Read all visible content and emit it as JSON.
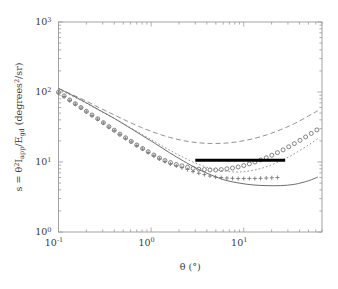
{
  "figure": {
    "background_color": "#ffffff",
    "frame_color": "#9a9a9a",
    "width": 338,
    "height": 289
  },
  "chart_data": {
    "type": "line",
    "title": "",
    "xlabel": "θ (°)",
    "ylabel": "s = θ²I_app/E_gd (degrees²/sr)",
    "xscale": "log",
    "yscale": "log",
    "xlim": [
      0.1,
      70.0
    ],
    "ylim": [
      1.0,
      1000.0
    ],
    "grid": false,
    "legend": "none",
    "x_tick_labels": [
      "10⁻¹",
      "10⁰",
      "10¹"
    ],
    "x_tick_values": [
      0.1,
      1.0,
      10.0
    ],
    "y_tick_labels": [
      "10⁰",
      "10¹",
      "10²",
      "10³"
    ],
    "y_tick_values": [
      1.0,
      10.0,
      100.0,
      1000.0
    ],
    "series": [
      {
        "name": "measured-circles",
        "style": "markers",
        "marker": "circle-open",
        "color": "#6e6e6e",
        "x": [
          0.1,
          0.115,
          0.132,
          0.152,
          0.175,
          0.2,
          0.23,
          0.265,
          0.305,
          0.35,
          0.4,
          0.46,
          0.53,
          0.61,
          0.7,
          0.81,
          0.93,
          1.07,
          1.23,
          1.41,
          1.62,
          1.87,
          2.15,
          2.47,
          2.84,
          3.27,
          3.76,
          4.32,
          4.97,
          5.72,
          6.58,
          7.56,
          8.7,
          10.0,
          11.5,
          13.2,
          15.2,
          17.5,
          20.1,
          23.1,
          26.6,
          30.6,
          35.2,
          40.5,
          46.6,
          53.6,
          61.6
        ],
        "y": [
          99.0,
          88.0,
          77.0,
          68.0,
          60.0,
          53.0,
          47.0,
          41.5,
          36.5,
          32.0,
          28.5,
          25.0,
          22.2,
          19.7,
          17.5,
          15.6,
          14.0,
          12.6,
          11.4,
          10.5,
          9.8,
          9.2,
          8.8,
          8.4,
          8.1,
          7.9,
          7.8,
          7.7,
          7.7,
          7.8,
          8.0,
          8.2,
          8.5,
          8.9,
          9.4,
          10.0,
          10.7,
          11.5,
          12.5,
          13.6,
          14.9,
          16.5,
          18.3,
          20.4,
          22.8,
          25.6,
          28.7
        ]
      },
      {
        "name": "measured-plus",
        "style": "markers",
        "marker": "plus",
        "color": "#7a7a7a",
        "x": [
          0.1,
          0.115,
          0.132,
          0.152,
          0.175,
          0.2,
          0.23,
          0.265,
          0.305,
          0.35,
          0.4,
          0.46,
          0.53,
          0.61,
          0.7,
          0.81,
          0.93,
          1.07,
          1.23,
          1.41,
          1.62,
          1.87,
          2.15,
          2.47,
          2.84,
          3.27,
          3.76,
          4.32,
          4.97,
          5.72,
          6.58,
          7.56,
          8.7,
          10.0,
          11.5,
          13.2,
          15.2,
          17.5,
          20.1,
          23.1
        ],
        "y": [
          97.0,
          86.0,
          76.0,
          67.0,
          59.0,
          52.0,
          46.0,
          41.0,
          36.0,
          31.5,
          28.0,
          24.6,
          21.8,
          19.3,
          17.2,
          15.3,
          13.7,
          12.3,
          11.1,
          10.2,
          9.4,
          8.8,
          8.3,
          7.8,
          7.3,
          6.9,
          6.6,
          6.3,
          6.1,
          6.0,
          5.9,
          5.85,
          5.8,
          5.8,
          5.8,
          5.8,
          5.85,
          5.9,
          5.95,
          6.0
        ]
      },
      {
        "name": "model-dashed-upper",
        "style": "dashed",
        "color": "#8c8c8c",
        "x": [
          0.1,
          0.14,
          0.2,
          0.28,
          0.4,
          0.56,
          0.79,
          1.12,
          1.58,
          2.24,
          3.16,
          4.47,
          6.31,
          8.91,
          12.6,
          17.8,
          25.1,
          35.5,
          50.1,
          63.0
        ],
        "y": [
          112.0,
          92.0,
          74.0,
          59.0,
          47.0,
          38.0,
          31.0,
          26.0,
          22.5,
          20.2,
          18.9,
          18.4,
          18.6,
          19.6,
          21.5,
          24.5,
          29.0,
          35.5,
          45.5,
          54.0
        ]
      },
      {
        "name": "model-dotted-middle",
        "style": "dotted",
        "color": "#8c8c8c",
        "x": [
          0.1,
          0.14,
          0.2,
          0.28,
          0.4,
          0.56,
          0.79,
          1.12,
          1.58,
          2.24,
          3.16,
          4.47,
          6.31,
          8.91,
          12.6,
          17.8,
          25.1,
          35.5,
          50.1,
          63.0
        ],
        "y": [
          110.0,
          88.0,
          69.0,
          54.0,
          42.0,
          32.5,
          25.0,
          19.2,
          14.8,
          11.6,
          9.4,
          8.1,
          7.4,
          7.2,
          7.6,
          8.6,
          10.4,
          13.2,
          17.5,
          21.5
        ]
      },
      {
        "name": "model-solid-lower",
        "style": "solid",
        "color": "#6e6e6e",
        "x": [
          0.1,
          0.14,
          0.2,
          0.28,
          0.4,
          0.56,
          0.79,
          1.12,
          1.58,
          2.24,
          3.16,
          4.47,
          6.31,
          8.91,
          12.6,
          17.8,
          25.1,
          35.5,
          50.1,
          63.0
        ],
        "y": [
          113.0,
          90.0,
          70.0,
          54.5,
          42.0,
          32.0,
          24.2,
          18.2,
          13.6,
          10.3,
          8.0,
          6.5,
          5.5,
          5.0,
          4.7,
          4.6,
          4.6,
          4.8,
          5.4,
          6.1
        ]
      }
    ],
    "annotations": [
      {
        "name": "horizontal-reference-bar",
        "type": "hline-segment",
        "color": "#000000",
        "y": 10.6,
        "x_start": 3.0,
        "x_end": 28.0,
        "linewidth": 3.2
      }
    ]
  },
  "axis": {
    "y_label_parts": {
      "prefix": "s = θ",
      "sup1": "2",
      "mid1": "I",
      "sub1": "app",
      "mid2": "/E",
      "sub2": "gd",
      "mid3": " (degrees",
      "sup2": "2",
      "suffix": "/sr)"
    },
    "x_label_parts": {
      "theta": "θ",
      "unit": "(°)"
    },
    "x_ticks": [
      {
        "label_base": "10",
        "label_exp": "-1",
        "value": 0.1
      },
      {
        "label_base": "10",
        "label_exp": "0",
        "value": 1.0
      },
      {
        "label_base": "10",
        "label_exp": "1",
        "value": 10.0
      }
    ],
    "y_ticks": [
      {
        "label_base": "10",
        "label_exp": "0",
        "value": 1.0
      },
      {
        "label_base": "10",
        "label_exp": "1",
        "value": 10.0
      },
      {
        "label_base": "10",
        "label_exp": "2",
        "value": 100.0
      },
      {
        "label_base": "10",
        "label_exp": "3",
        "value": 1000.0
      }
    ]
  }
}
